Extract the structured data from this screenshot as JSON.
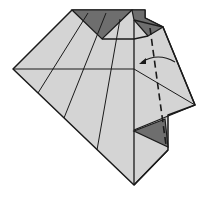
{
  "diagram": {
    "type": "origami-crease-pattern",
    "colors": {
      "paper_light": "#d4d4d4",
      "paper_dark": "#6e6e6e",
      "line": "#1a1a1a",
      "background": "#ffffff"
    },
    "annotations": {
      "fold_line": "valley-fold (dashed)",
      "arrow": "fold direction arrow"
    }
  }
}
